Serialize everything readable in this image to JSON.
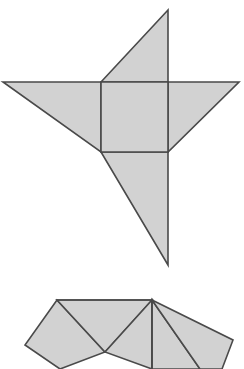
{
  "canvas": {
    "width": 244,
    "height": 369,
    "background_color": "#ffffff"
  },
  "style": {
    "face_fill_color": "#d2d2d2",
    "edge_stroke_color": "#4a4a4a",
    "edge_stroke_width": 1.6
  },
  "figures": [
    {
      "id": "upper-figure",
      "name": "pinwheel-net-upper",
      "description": "Four-pointed pinwheel shape: central square with four right-triangle wings rotating around it",
      "parts": [
        {
          "name": "central-square",
          "shape": "square",
          "points": "101,82 168,82 168,152 101,152"
        },
        {
          "name": "top-wing-triangle",
          "shape": "triangle",
          "points": "101,82 168,10 168,82"
        },
        {
          "name": "right-wing-triangle",
          "shape": "triangle",
          "points": "168,82 239,82 168,152"
        },
        {
          "name": "bottom-wing-triangle",
          "shape": "triangle",
          "points": "168,152 168,265 101,152"
        },
        {
          "name": "left-wing-triangle",
          "shape": "triangle",
          "points": "101,82 3,82 101,152"
        }
      ]
    },
    {
      "id": "lower-figure",
      "name": "polygon-net-lower-cropped",
      "description": "Partially visible lower net: fan of quadrilateral and triangular faces radiating from a top apex, cropped by the bottom image edge",
      "parts": [
        {
          "name": "left-quadrilateral-face",
          "shape": "quadrilateral",
          "points": "57,300 25,345 60,369 105,352"
        },
        {
          "name": "left-center-triangle-face",
          "shape": "triangle",
          "points": "57,300 152,300 105,352"
        },
        {
          "name": "lower-left-notch-triangle",
          "shape": "triangle",
          "points": "105,352 60,369 150,369"
        },
        {
          "name": "center-triangle-face",
          "shape": "triangle",
          "points": "105,352 152,300 152,369"
        },
        {
          "name": "center-right-triangle-face",
          "shape": "triangle",
          "points": "152,300 200,369 152,369"
        },
        {
          "name": "right-quadrilateral-face",
          "shape": "quadrilateral",
          "points": "152,300 233,340 222,369 200,369"
        }
      ],
      "fold_lines": [
        {
          "name": "apex-vertical-fold",
          "points": "152,300 152,369"
        },
        {
          "name": "apex-top-edge-fold",
          "points": "57,300 152,300"
        }
      ]
    }
  ]
}
